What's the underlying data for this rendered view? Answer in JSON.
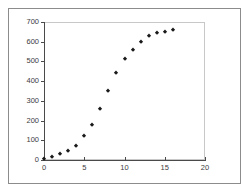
{
  "figure": {
    "background_color": "#ffffff",
    "frame_color": "#8c8c8c",
    "panel_border_color": "#c8c8c8",
    "axis_color": "#4a4a4a",
    "marker_color": "#1a1a1a"
  },
  "chart_data": {
    "type": "scatter",
    "title": "",
    "subtitle": "",
    "xlabel": "",
    "ylabel": "",
    "xlim": [
      0,
      20
    ],
    "ylim": [
      0,
      700
    ],
    "grid": false,
    "legend": null,
    "marker": "diamond",
    "xticks": [
      0,
      5,
      10,
      15,
      20
    ],
    "xtick_labels": [
      "0",
      "5",
      "10",
      "15",
      "20"
    ],
    "yticks": [
      0,
      100,
      200,
      300,
      400,
      500,
      600,
      700
    ],
    "ytick_labels": [
      "0",
      "100",
      "200",
      "300",
      "400",
      "500",
      "600",
      "700"
    ],
    "series": [
      {
        "name": "series-1",
        "x": [
          0,
          1,
          2,
          3,
          4,
          5,
          6,
          7,
          8,
          9,
          10,
          11,
          12,
          13,
          14,
          15,
          16
        ],
        "y": [
          5,
          15,
          28,
          45,
          70,
          120,
          178,
          257,
          350,
          440,
          510,
          560,
          597,
          628,
          643,
          650,
          657
        ]
      }
    ]
  }
}
